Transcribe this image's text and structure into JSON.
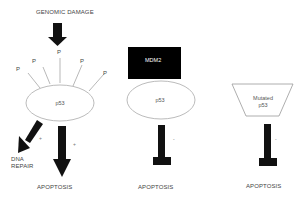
{
  "diagram": {
    "top_label": "GENOMIC DAMAGE",
    "panels": [
      {
        "id": "wildtype",
        "protein_label": "p53",
        "phospho_label": "P",
        "phospho_count": 5,
        "outcomes": [
          {
            "label_line1": "DNA",
            "label_line2": "REPAIR",
            "sign": "+"
          },
          {
            "label": "APOPTOSIS",
            "sign": "+"
          }
        ]
      },
      {
        "id": "mdm2-bound",
        "inhibitor_label": "MDM2",
        "protein_label": "p53",
        "outcome": {
          "label": "APOPTOSIS",
          "sign": "-"
        }
      },
      {
        "id": "mutated",
        "protein_label_line1": "Mutated",
        "protein_label_line2": "p53",
        "outcome": {
          "label": "APOPTOSIS",
          "sign": "-"
        }
      }
    ]
  },
  "colors": {
    "arrow": "#111111",
    "outline": "#999999",
    "mdm2_box": "#000000",
    "text": "#444444"
  }
}
